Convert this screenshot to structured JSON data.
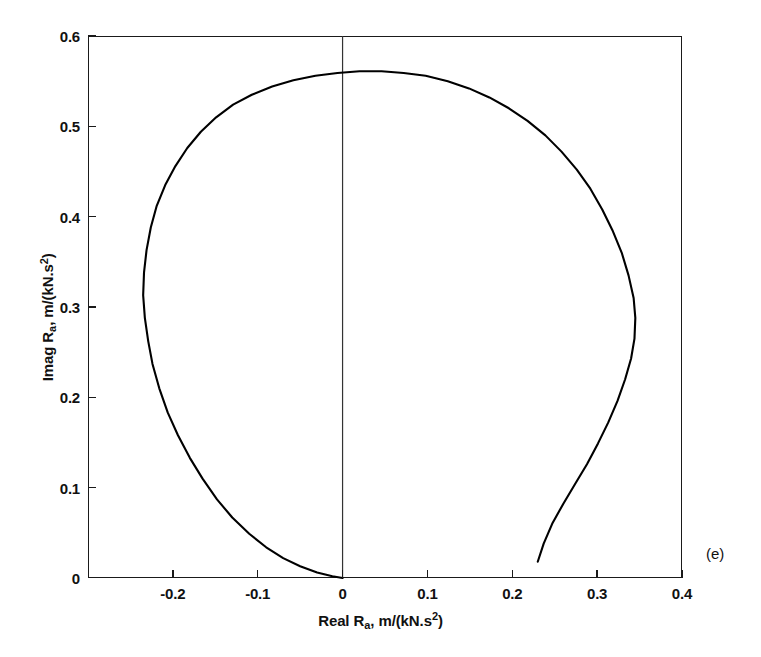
{
  "figure": {
    "panel_label": "(e)",
    "background_color": "#ffffff",
    "line_color": "#000000",
    "axis_color": "#1a1a1a"
  },
  "chart_data": {
    "type": "line",
    "title": "",
    "subtitle": "",
    "xlabel": "Real R_a, m/(kN.s^2)",
    "ylabel": "Imag R_a, m/(kN.s^2)",
    "xlabel_parts": {
      "prefix": "Real R",
      "subscript": "a",
      "suffix": ", m/(kN.s",
      "superscript": "2",
      "tail": ")"
    },
    "ylabel_parts": {
      "prefix": "Imag R",
      "subscript": "a",
      "suffix": ", m/(kN.s",
      "superscript": "2",
      "tail": ")"
    },
    "xlim": [
      -0.3,
      0.4
    ],
    "ylim": [
      0,
      0.6
    ],
    "xticks": [
      -0.3,
      -0.2,
      -0.1,
      0,
      0.1,
      0.2,
      0.3,
      0.4
    ],
    "xtick_labels": [
      "",
      "-0.2",
      "-0.1",
      "0",
      "0.1",
      "0.2",
      "0.3",
      "0.4"
    ],
    "yticks": [
      0,
      0.1,
      0.2,
      0.3,
      0.4,
      0.5,
      0.6
    ],
    "ytick_labels": [
      "0",
      "0.1",
      "0.2",
      "0.3",
      "0.4",
      "0.5",
      "0.6"
    ],
    "grid": false,
    "legend": null,
    "legend_position": "none",
    "annotations": [
      {
        "text": "(e)",
        "x": 0.44,
        "y": 0.025
      }
    ],
    "reference_lines": [
      {
        "orientation": "vertical",
        "value": 0,
        "color": "#333333",
        "width": 1
      }
    ],
    "series": [
      {
        "name": "Nyquist loop of accelerance R_a",
        "points": [
          [
            0.0,
            0.0
          ],
          [
            -0.012,
            0.002
          ],
          [
            -0.03,
            0.006
          ],
          [
            -0.05,
            0.013
          ],
          [
            -0.07,
            0.022
          ],
          [
            -0.09,
            0.034
          ],
          [
            -0.11,
            0.049
          ],
          [
            -0.13,
            0.067
          ],
          [
            -0.148,
            0.087
          ],
          [
            -0.165,
            0.11
          ],
          [
            -0.18,
            0.133
          ],
          [
            -0.194,
            0.158
          ],
          [
            -0.206,
            0.183
          ],
          [
            -0.216,
            0.21
          ],
          [
            -0.224,
            0.237
          ],
          [
            -0.229,
            0.262
          ],
          [
            -0.233,
            0.288
          ],
          [
            -0.235,
            0.313
          ],
          [
            -0.234,
            0.338
          ],
          [
            -0.231,
            0.363
          ],
          [
            -0.226,
            0.388
          ],
          [
            -0.219,
            0.412
          ],
          [
            -0.209,
            0.435
          ],
          [
            -0.197,
            0.456
          ],
          [
            -0.183,
            0.476
          ],
          [
            -0.167,
            0.494
          ],
          [
            -0.149,
            0.51
          ],
          [
            -0.129,
            0.524
          ],
          [
            -0.107,
            0.535
          ],
          [
            -0.083,
            0.544
          ],
          [
            -0.058,
            0.551
          ],
          [
            -0.032,
            0.556
          ],
          [
            -0.006,
            0.559
          ],
          [
            0.02,
            0.561
          ],
          [
            0.046,
            0.561
          ],
          [
            0.072,
            0.559
          ],
          [
            0.098,
            0.556
          ],
          [
            0.124,
            0.55
          ],
          [
            0.149,
            0.542
          ],
          [
            0.173,
            0.532
          ],
          [
            0.196,
            0.52
          ],
          [
            0.218,
            0.506
          ],
          [
            0.239,
            0.49
          ],
          [
            0.258,
            0.472
          ],
          [
            0.276,
            0.452
          ],
          [
            0.292,
            0.431
          ],
          [
            0.306,
            0.408
          ],
          [
            0.318,
            0.385
          ],
          [
            0.329,
            0.36
          ],
          [
            0.337,
            0.335
          ],
          [
            0.343,
            0.31
          ],
          [
            0.345,
            0.288
          ],
          [
            0.344,
            0.265
          ],
          [
            0.34,
            0.243
          ],
          [
            0.333,
            0.22
          ],
          [
            0.324,
            0.196
          ],
          [
            0.313,
            0.172
          ],
          [
            0.301,
            0.149
          ],
          [
            0.288,
            0.126
          ],
          [
            0.274,
            0.104
          ],
          [
            0.26,
            0.082
          ],
          [
            0.247,
            0.06
          ],
          [
            0.237,
            0.038
          ],
          [
            0.23,
            0.018
          ]
        ]
      }
    ]
  }
}
